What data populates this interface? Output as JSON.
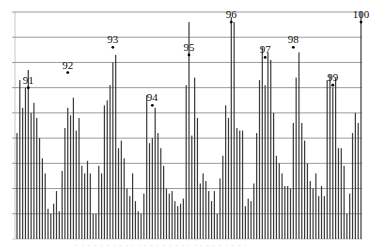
{
  "chart_data": {
    "type": "bar",
    "title": "",
    "xlabel": "",
    "ylabel": "",
    "grid": true,
    "legend": "none",
    "ylim": [
      0,
      9
    ],
    "grid_lines": 9,
    "plot_area": {
      "left": 16,
      "right": 362,
      "top": 12,
      "bottom": 239
    },
    "colors": {
      "bar": "#3a3a3a",
      "grid": "#9a9a9a",
      "axis": "#c8c8c8",
      "marker": "#000000",
      "label": "#111111"
    },
    "values": [
      4.2,
      6.3,
      5.2,
      6.0,
      6.7,
      5.0,
      5.4,
      4.8,
      4.0,
      3.2,
      2.6,
      1.2,
      1.0,
      1.4,
      1.9,
      1.1,
      2.7,
      4.4,
      5.2,
      4.9,
      5.6,
      4.3,
      4.8,
      2.9,
      2.6,
      3.1,
      2.6,
      1.0,
      1.0,
      2.9,
      2.6,
      5.3,
      5.5,
      6.1,
      7.0,
      7.3,
      3.6,
      3.9,
      3.2,
      2.0,
      1.7,
      2.6,
      1.5,
      1.1,
      1.0,
      1.8,
      5.7,
      3.8,
      4.0,
      5.2,
      4.2,
      3.6,
      2.9,
      2.0,
      1.8,
      1.9,
      1.5,
      1.3,
      1.4,
      1.6,
      6.1,
      8.6,
      4.1,
      6.4,
      4.8,
      2.2,
      2.6,
      2.3,
      1.9,
      1.5,
      1.9,
      1.0,
      2.4,
      3.3,
      5.3,
      4.8,
      8.8,
      8.6,
      4.4,
      4.3,
      4.3,
      1.3,
      1.6,
      1.5,
      2.2,
      4.2,
      6.3,
      7.6,
      6.1,
      7.4,
      7.1,
      5.0,
      3.3,
      3.0,
      2.6,
      2.1,
      2.1,
      2.0,
      4.6,
      6.4,
      7.4,
      4.6,
      3.9,
      3.0,
      2.3,
      2.0,
      2.6,
      1.7,
      2.1,
      1.7,
      6.3,
      6.5,
      6.0,
      6.4,
      3.6,
      3.6,
      2.9,
      1.0,
      1.8,
      4.2,
      5.0,
      4.6,
      9.0
    ],
    "annotations": [
      {
        "label": "91",
        "bar_index": 4,
        "value": 6.0
      },
      {
        "label": "92",
        "bar_index": 18,
        "value": 6.6
      },
      {
        "label": "93",
        "bar_index": 34,
        "value": 7.6
      },
      {
        "label": "94",
        "bar_index": 48,
        "value": 5.3
      },
      {
        "label": "95",
        "bar_index": 61,
        "value": 7.3
      },
      {
        "label": "96",
        "bar_index": 76,
        "value": 8.6
      },
      {
        "label": "97",
        "bar_index": 88,
        "value": 7.2
      },
      {
        "label": "98",
        "bar_index": 98,
        "value": 7.6
      },
      {
        "label": "99",
        "bar_index": 112,
        "value": 6.1
      },
      {
        "label": "100",
        "bar_index": 122,
        "value": 8.6
      }
    ],
    "footer_text": "· · · · ·  · ·  ·  · · · ·  · · · · ·  · · · ·  · · · ·  · · ·"
  }
}
